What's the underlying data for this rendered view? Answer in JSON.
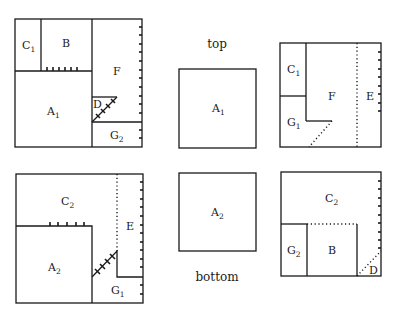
{
  "captions": {
    "top": "top",
    "bottom": "bottom"
  },
  "panels": {
    "top_left": {
      "regions": [
        {
          "letter": "C",
          "sub": "1"
        },
        {
          "letter": "B",
          "sub": ""
        },
        {
          "letter": "F",
          "sub": ""
        },
        {
          "letter": "A",
          "sub": "1"
        },
        {
          "letter": "D",
          "sub": ""
        },
        {
          "letter": "G",
          "sub": "2"
        }
      ]
    },
    "top_middle": {
      "regions": [
        {
          "letter": "A",
          "sub": "1"
        }
      ]
    },
    "top_right": {
      "regions": [
        {
          "letter": "C",
          "sub": "1"
        },
        {
          "letter": "F",
          "sub": ""
        },
        {
          "letter": "E",
          "sub": ""
        },
        {
          "letter": "G",
          "sub": "1"
        }
      ]
    },
    "bottom_left": {
      "regions": [
        {
          "letter": "C",
          "sub": "2"
        },
        {
          "letter": "E",
          "sub": ""
        },
        {
          "letter": "A",
          "sub": "2"
        },
        {
          "letter": "G",
          "sub": "1"
        }
      ]
    },
    "bottom_middle": {
      "regions": [
        {
          "letter": "A",
          "sub": "2"
        }
      ]
    },
    "bottom_right": {
      "regions": [
        {
          "letter": "C",
          "sub": "2"
        },
        {
          "letter": "G",
          "sub": "2"
        },
        {
          "letter": "B",
          "sub": ""
        },
        {
          "letter": "D",
          "sub": ""
        }
      ]
    }
  }
}
